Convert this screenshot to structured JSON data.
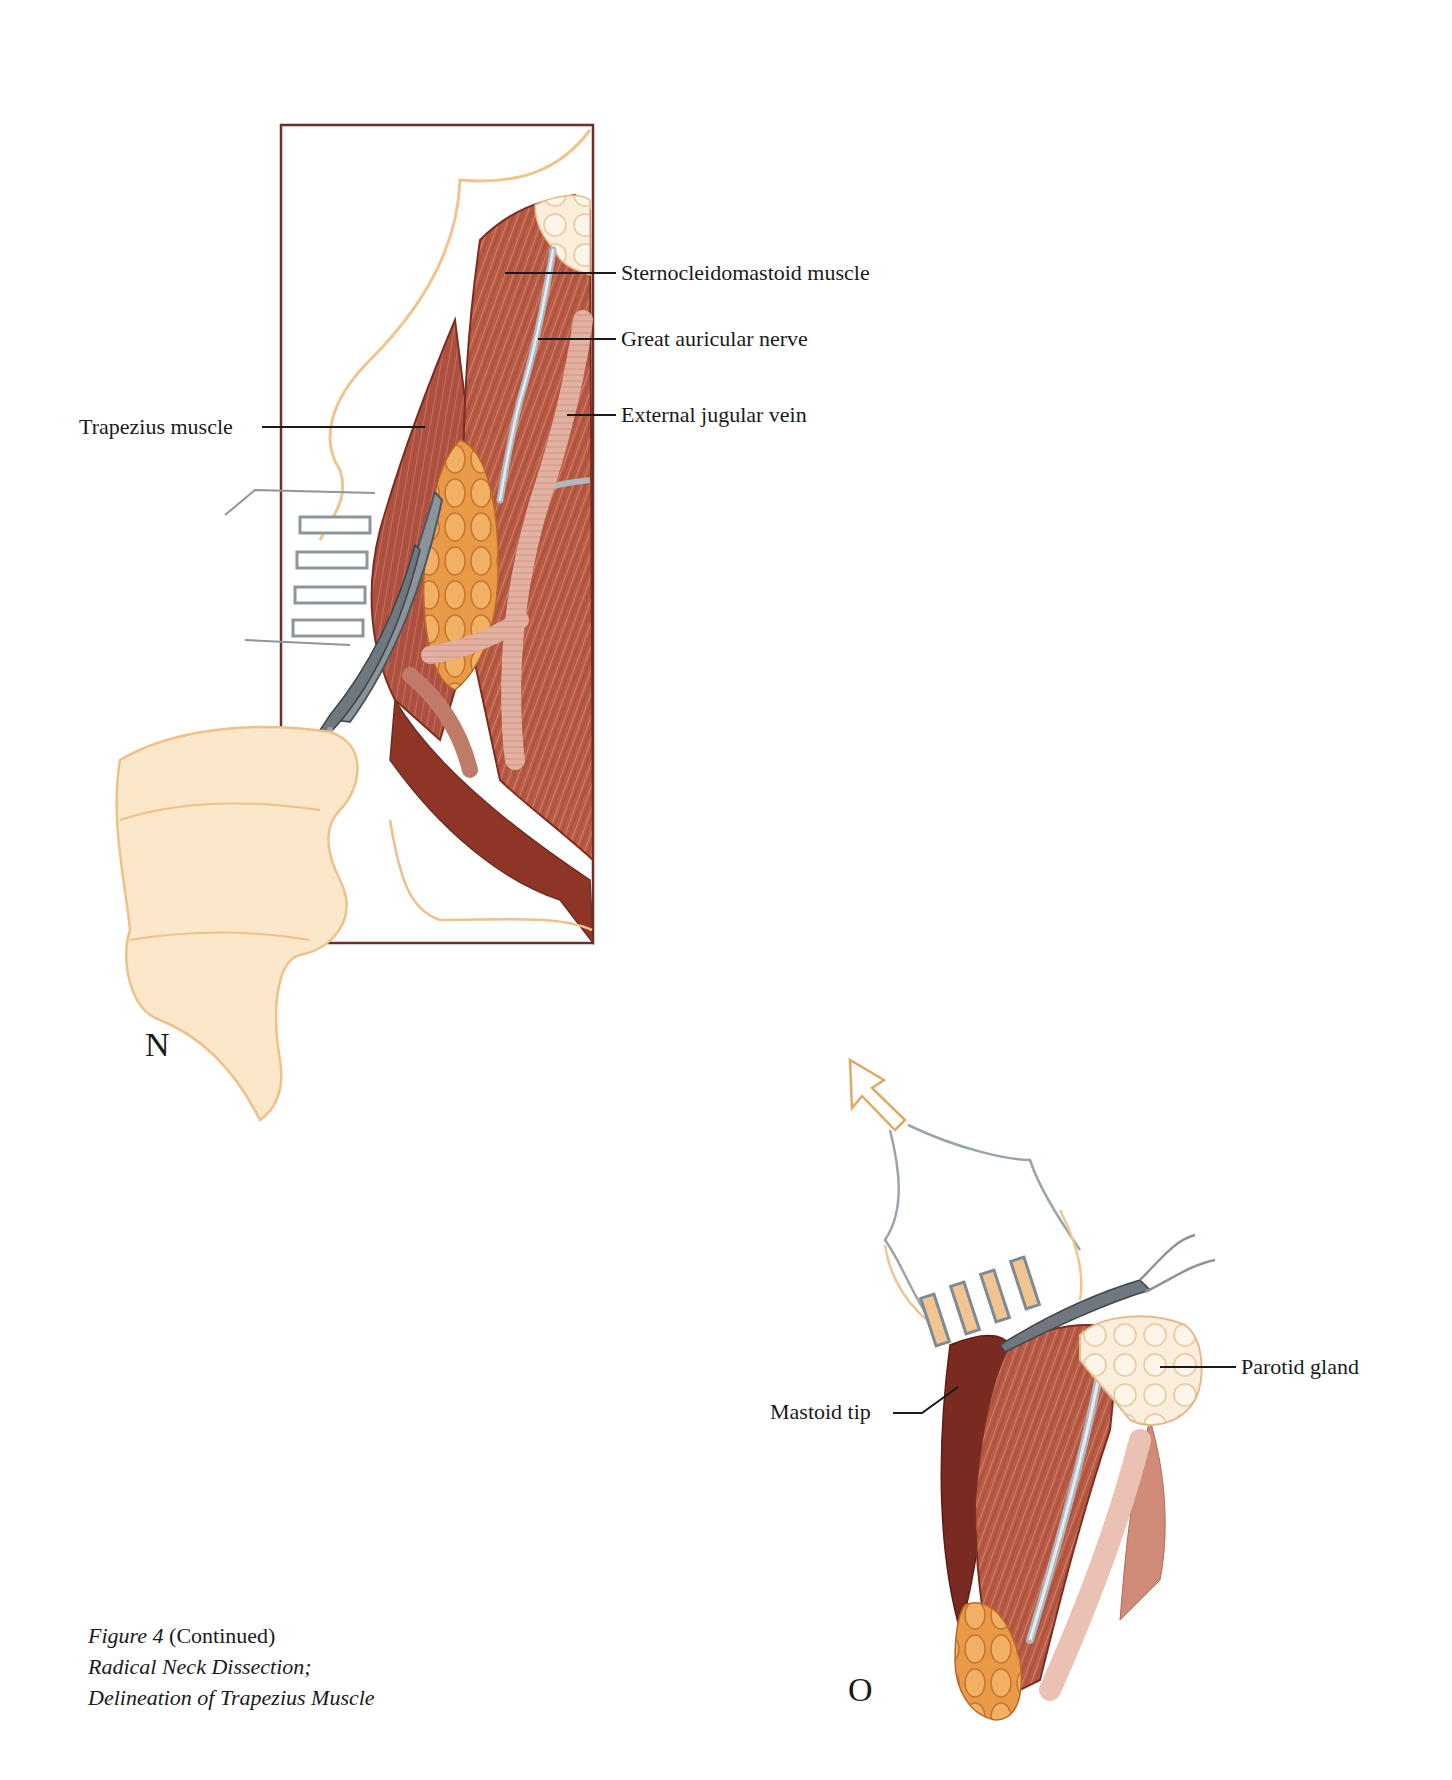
{
  "figure": {
    "caption": {
      "figure_label": "Figure 4",
      "continued": "(Continued)",
      "line2": "Radical Neck Dissection;",
      "line3": "Delineation of Trapezius Muscle"
    },
    "panels": [
      {
        "id": "N",
        "letter": "N",
        "labels": [
          {
            "key": "sternocleidomastoid",
            "text": "Sternocleidomastoid muscle"
          },
          {
            "key": "great_auricular",
            "text": "Great auricular nerve"
          },
          {
            "key": "external_jugular",
            "text": "External jugular vein"
          },
          {
            "key": "trapezius",
            "text": "Trapezius muscle"
          }
        ]
      },
      {
        "id": "O",
        "letter": "O",
        "labels": [
          {
            "key": "parotid",
            "text": "Parotid gland"
          },
          {
            "key": "mastoid",
            "text": "Mastoid tip"
          }
        ]
      }
    ],
    "colors": {
      "muscle": "#b85a45",
      "muscle_dark": "#7a2e22",
      "fat": "#e59a4a",
      "vein": "#e3b3a3",
      "nerve": "#b9c2c8",
      "skin_outline": "#f0c48c",
      "glove": "#fbe7c8",
      "retractor": "#7d8b94",
      "frame": "#6b2f28",
      "leader": "#1a1a1a"
    }
  }
}
